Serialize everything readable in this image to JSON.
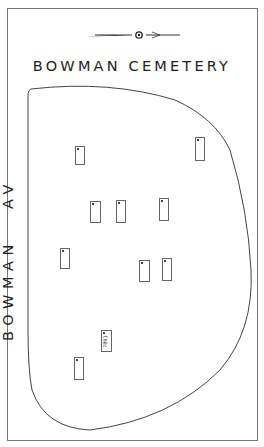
{
  "map": {
    "title": "BOWMAN CEMETERY",
    "street_label": "BOWMAN   AV",
    "compass": "north-arrow",
    "plots": [
      {
        "id": "p1",
        "x": 75,
        "y": 146,
        "w": 10,
        "h": 19,
        "label": ""
      },
      {
        "id": "p2",
        "x": 195,
        "y": 137,
        "w": 10,
        "h": 24,
        "label": ""
      },
      {
        "id": "p3",
        "x": 90,
        "y": 201,
        "w": 11,
        "h": 22,
        "label": ""
      },
      {
        "id": "p4",
        "x": 116,
        "y": 200,
        "w": 10,
        "h": 23,
        "label": ""
      },
      {
        "id": "p5",
        "x": 159,
        "y": 198,
        "w": 10,
        "h": 23,
        "label": ""
      },
      {
        "id": "p6",
        "x": 60,
        "y": 248,
        "w": 10,
        "h": 21,
        "label": ""
      },
      {
        "id": "p7",
        "x": 139,
        "y": 260,
        "w": 11,
        "h": 22,
        "label": ""
      },
      {
        "id": "p8",
        "x": 162,
        "y": 258,
        "w": 10,
        "h": 23,
        "label": ""
      },
      {
        "id": "p9",
        "x": 101,
        "y": 330,
        "w": 11,
        "h": 22,
        "label": "7891"
      },
      {
        "id": "p10",
        "x": 74,
        "y": 357,
        "w": 10,
        "h": 23,
        "label": ""
      }
    ]
  },
  "colors": {
    "line": "#444444",
    "background": "#ffffff"
  }
}
